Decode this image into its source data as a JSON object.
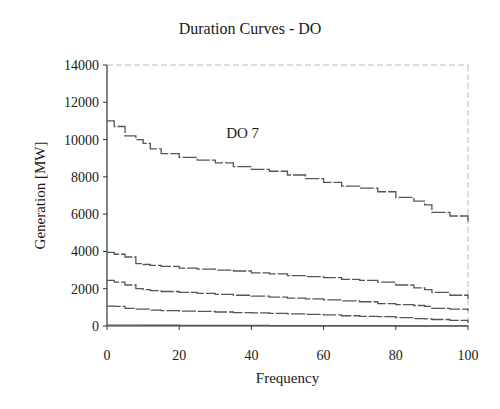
{
  "chart_data": {
    "type": "line",
    "title": "Duration Curves - DO",
    "xlabel": "Frequency",
    "ylabel": "Generation [MW]",
    "xlim": [
      0,
      100
    ],
    "ylim": [
      0,
      14000
    ],
    "xticks": [
      0,
      20,
      40,
      60,
      80,
      100
    ],
    "yticks": [
      0,
      2000,
      4000,
      6000,
      8000,
      10000,
      12000,
      14000
    ],
    "grid": false,
    "legend": "none",
    "annotations": [
      {
        "text": "DO 7",
        "x": 33,
        "y": 10000
      }
    ],
    "x": [
      0,
      2,
      5,
      8,
      10,
      12,
      15,
      20,
      25,
      30,
      35,
      40,
      45,
      50,
      55,
      60,
      65,
      70,
      75,
      80,
      85,
      88,
      90,
      95,
      100
    ],
    "series": [
      {
        "name": "DO 7",
        "values": [
          11000,
          10700,
          10200,
          10000,
          9800,
          9500,
          9250,
          9050,
          8900,
          8750,
          8550,
          8400,
          8300,
          8100,
          7900,
          7700,
          7500,
          7400,
          7200,
          6900,
          6700,
          6500,
          6100,
          5900,
          5600
        ]
      },
      {
        "name": "Curve 2",
        "values": [
          3950,
          3850,
          3700,
          3350,
          3300,
          3250,
          3200,
          3100,
          3050,
          3000,
          2950,
          2850,
          2800,
          2700,
          2650,
          2600,
          2500,
          2450,
          2350,
          2200,
          2050,
          1950,
          1800,
          1650,
          1450
        ]
      },
      {
        "name": "Curve 3",
        "values": [
          2450,
          2350,
          2200,
          2000,
          1950,
          1900,
          1850,
          1800,
          1750,
          1700,
          1650,
          1600,
          1550,
          1500,
          1450,
          1400,
          1350,
          1300,
          1200,
          1150,
          1100,
          1050,
          950,
          900,
          800
        ]
      },
      {
        "name": "Curve 4",
        "values": [
          1070,
          1050,
          950,
          900,
          900,
          850,
          820,
          800,
          780,
          750,
          720,
          700,
          680,
          650,
          620,
          600,
          550,
          520,
          500,
          450,
          400,
          380,
          350,
          300,
          170
        ]
      },
      {
        "name": "Curve 5",
        "values": [
          50,
          50,
          45,
          45,
          40,
          40,
          40,
          35,
          35,
          30,
          30,
          30,
          25,
          25,
          20,
          20,
          20,
          15,
          15,
          10,
          10,
          10,
          5,
          5,
          0
        ]
      }
    ]
  }
}
